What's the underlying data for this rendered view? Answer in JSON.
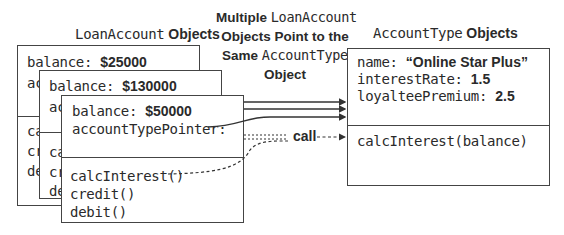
{
  "titles": {
    "loan_mono": "LoanAccount",
    "loan_sans": " Objects",
    "acct_mono": "AccountType",
    "acct_sans": " Objects"
  },
  "callout": {
    "line1_sans": "Multiple ",
    "line1_mono": "LoanAccount",
    "line2": "Objects Point to the",
    "line3_sans": "Same ",
    "line3_mono": "AccountType",
    "line4": "Object"
  },
  "loan_accounts": [
    {
      "balance_label": "balance: ",
      "balance_value": "$25000",
      "pointer_label_clipped": "ac",
      "methods_clipped": [
        "ca",
        "cr",
        "de"
      ]
    },
    {
      "balance_label": "balance: ",
      "balance_value": "$130000",
      "pointer_label_clipped": "ac",
      "methods_clipped": [
        "ca",
        "cr",
        "de"
      ]
    },
    {
      "balance_label": "balance: ",
      "balance_value": "$50000",
      "pointer_label": "accountTypePointer:",
      "methods": [
        "calcInterest()",
        "credit()",
        "debit()"
      ]
    }
  ],
  "account_type": {
    "fields": [
      {
        "label": "name: ",
        "value": "“Online Star Plus”"
      },
      {
        "label": "interestRate: ",
        "value": "1.5"
      },
      {
        "label": "loyalteePremium: ",
        "value": "2.5"
      }
    ],
    "methods": [
      "calcInterest(balance)"
    ]
  },
  "call_label": "call",
  "colors": {
    "stroke": "#444444",
    "text": "#2a2a2a",
    "background": "#ffffff"
  }
}
